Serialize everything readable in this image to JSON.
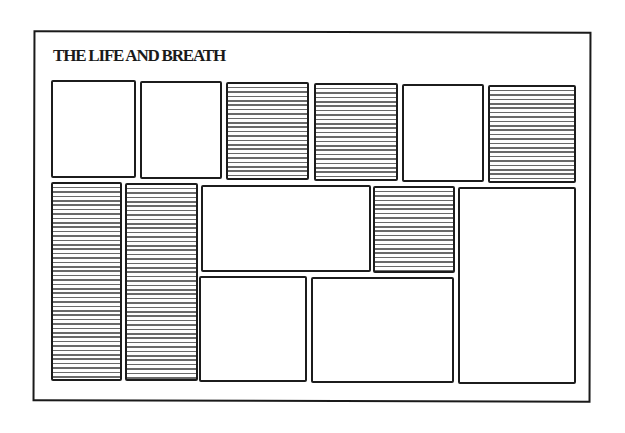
{
  "layout_mockup": {
    "masthead": "THE LIFE AND BREATH",
    "panels": [
      {
        "id": "p1",
        "row": "top",
        "fill": "blank"
      },
      {
        "id": "p2",
        "row": "top",
        "fill": "blank"
      },
      {
        "id": "p3",
        "row": "top",
        "fill": "striped"
      },
      {
        "id": "p4",
        "row": "top",
        "fill": "striped"
      },
      {
        "id": "p5",
        "row": "top",
        "fill": "blank"
      },
      {
        "id": "p6",
        "row": "top",
        "fill": "striped"
      },
      {
        "id": "p7",
        "row": "lower",
        "fill": "striped"
      },
      {
        "id": "p8",
        "row": "lower",
        "fill": "striped"
      },
      {
        "id": "p9",
        "row": "lower",
        "fill": "blank"
      },
      {
        "id": "p10",
        "row": "lower",
        "fill": "striped"
      },
      {
        "id": "p11",
        "row": "lower",
        "fill": "blank"
      },
      {
        "id": "p12",
        "row": "bottom",
        "fill": "blank"
      },
      {
        "id": "p13",
        "row": "bottom",
        "fill": "blank"
      }
    ],
    "colors": {
      "ink": "#1a1a1a",
      "stripe": "#6a6a6a",
      "paper": "#ffffff"
    }
  }
}
